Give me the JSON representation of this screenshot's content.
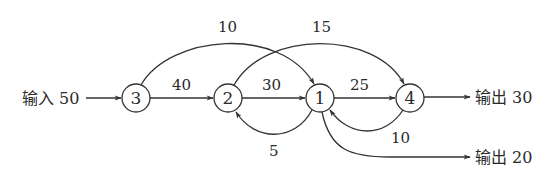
{
  "diagram": {
    "type": "flow-network",
    "nodes": [
      {
        "id": "3",
        "label": "3",
        "cx": 136,
        "cy": 98
      },
      {
        "id": "2",
        "label": "2",
        "cx": 228,
        "cy": 98
      },
      {
        "id": "1",
        "label": "1",
        "cx": 320,
        "cy": 98
      },
      {
        "id": "4",
        "label": "4",
        "cx": 410,
        "cy": 98
      }
    ],
    "input": {
      "label": "输入 50",
      "to": "3"
    },
    "outputs": [
      {
        "label": "输出 30",
        "from": "4"
      },
      {
        "label": "输出 20",
        "from": "1"
      }
    ],
    "edges": [
      {
        "from": "3",
        "to": "2",
        "value": "40"
      },
      {
        "from": "2",
        "to": "1",
        "value": "30"
      },
      {
        "from": "1",
        "to": "4",
        "value": "25"
      },
      {
        "from": "3",
        "to": "1",
        "value": "10"
      },
      {
        "from": "2",
        "to": "4",
        "value": "15"
      },
      {
        "from": "1",
        "to": "2",
        "value": "5"
      },
      {
        "from": "4",
        "to": "1",
        "value": "10"
      }
    ],
    "colors": {
      "stroke": "#333333",
      "text": "#2a2a2a",
      "background": "#ffffff"
    }
  }
}
